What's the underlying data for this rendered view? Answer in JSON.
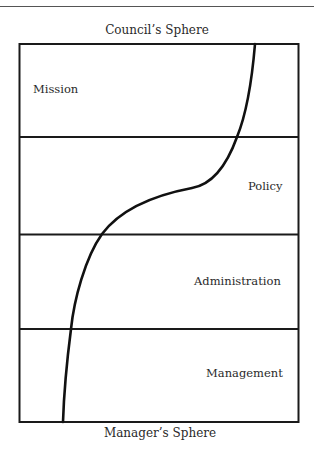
{
  "diagram": {
    "top_caption": "Council’s Sphere",
    "bottom_caption": "Manager’s Sphere",
    "zones": [
      {
        "label": "Mission"
      },
      {
        "label": "Policy"
      },
      {
        "label": "Administration"
      },
      {
        "label": "Management"
      }
    ],
    "colors": {
      "line": "#1a1a1a",
      "text": "#2a2a2a",
      "background": "#ffffff"
    }
  }
}
